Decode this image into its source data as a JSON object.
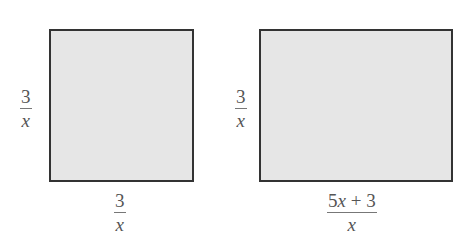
{
  "figures": [
    {
      "name": "square",
      "shape": "rectangle",
      "fill_color": "#e6e6e6",
      "border_color": "#333333",
      "side_label": {
        "numerator": "3",
        "denominator": "x"
      },
      "bottom_label": {
        "numerator": "3",
        "denominator": "x"
      }
    },
    {
      "name": "rectangle",
      "shape": "rectangle",
      "fill_color": "#e6e6e6",
      "border_color": "#333333",
      "side_label": {
        "numerator": "3",
        "denominator": "x"
      },
      "bottom_label": {
        "numerator_coef": "5",
        "numerator_var": "x",
        "numerator_rest": " + 3",
        "denominator": "x"
      }
    }
  ]
}
